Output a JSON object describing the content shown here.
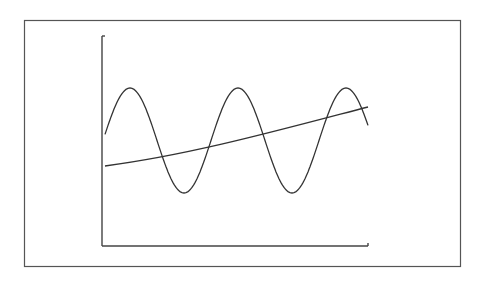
{
  "figure": {
    "stroke_color": "#333333",
    "frame_color": "#555555",
    "background": "#ffffff"
  },
  "chart_data": {
    "type": "line",
    "title": "",
    "xlabel": "",
    "ylabel": "",
    "grid": false,
    "legend": null,
    "tick_labels": {
      "x": [],
      "y": []
    },
    "series": [
      {
        "name": "sine",
        "shape": "sinusoid, ~2.75 cycles, constant amplitude",
        "x_px": [
          105,
          130,
          158,
          187,
          210,
          232,
          265,
          297,
          325,
          350,
          368
        ],
        "y_px": [
          132,
          88,
          140,
          193,
          140,
          88,
          140,
          193,
          140,
          88,
          105
        ]
      },
      {
        "name": "trend",
        "shape": "slowly increasing nearly-linear line",
        "x_px": [
          105,
          368
        ],
        "y_px": [
          166,
          107
        ]
      }
    ],
    "axes_px": {
      "origin": [
        102,
        246
      ],
      "y_top": 36,
      "x_right": 368
    }
  }
}
